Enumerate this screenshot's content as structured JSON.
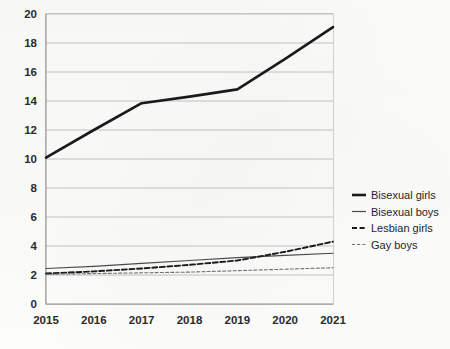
{
  "chart_data": {
    "type": "line",
    "title": "",
    "subtitle": "",
    "xlabel": "",
    "ylabel": "",
    "x": [
      2015,
      2016,
      2017,
      2018,
      2019,
      2020,
      2021
    ],
    "categories": [
      "2015",
      "2016",
      "2017",
      "2018",
      "2019",
      "2020",
      "2021"
    ],
    "xtick_labels": [
      "2015",
      "2016",
      "2017",
      "2018",
      "2019",
      "2020",
      "2021"
    ],
    "ytick_labels": [
      "0",
      "2",
      "4",
      "6",
      "8",
      "10",
      "12",
      "14",
      "16",
      "18",
      "20"
    ],
    "yticks": [
      0,
      2,
      4,
      6,
      8,
      10,
      12,
      14,
      16,
      18,
      20
    ],
    "ylim": [
      0,
      20
    ],
    "xlim": [
      2015,
      2021
    ],
    "grid": "horizontal",
    "legend_position": "right",
    "series": [
      {
        "name": "Bisexual girls",
        "style": "solid-thick",
        "color": "#1a1a1a",
        "values": [
          10.1,
          12.0,
          13.85,
          14.3,
          14.8,
          16.9,
          19.1
        ]
      },
      {
        "name": "Bisexual boys",
        "style": "solid-thin",
        "color": "#4a4a4a",
        "values": [
          2.45,
          2.6,
          2.8,
          3.0,
          3.2,
          3.35,
          3.5
        ]
      },
      {
        "name": "Lesbian girls",
        "style": "dashed",
        "color": "#1a1a1a",
        "values": [
          2.1,
          2.25,
          2.45,
          2.7,
          3.0,
          3.6,
          4.3
        ]
      },
      {
        "name": "Gay boys",
        "style": "dotted",
        "color": "#707070",
        "values": [
          2.05,
          2.1,
          2.15,
          2.2,
          2.3,
          2.4,
          2.5
        ]
      }
    ]
  },
  "legend": {
    "entries": [
      {
        "label": "Bisexual girls"
      },
      {
        "label": "Bisexual boys"
      },
      {
        "label": "Lesbian girls"
      },
      {
        "label": "Gay boys"
      }
    ]
  },
  "colors": {
    "background": "#fbfbfa",
    "gridline": "#b9b9b9",
    "axis": "#8d8d8d",
    "text": "#2b2b2b"
  }
}
